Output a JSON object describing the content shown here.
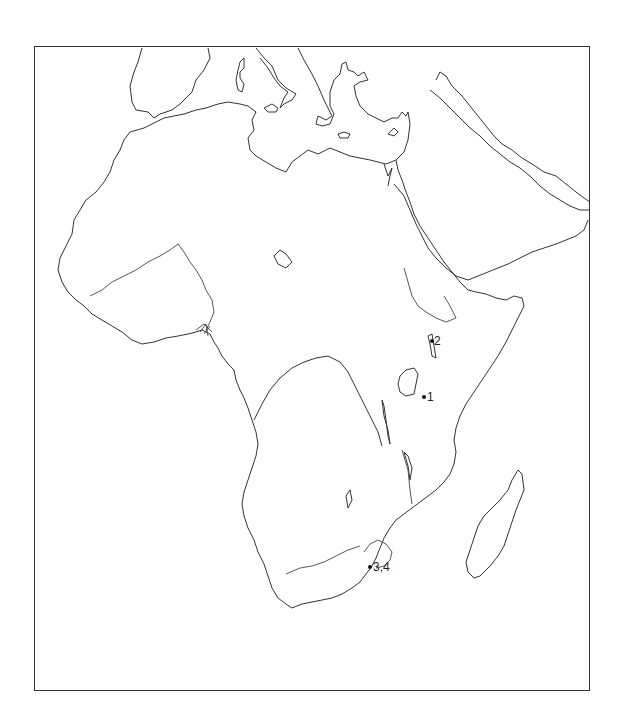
{
  "map": {
    "region": "Africa and Arabian Peninsula outline map",
    "frame": {
      "x": 34,
      "y": 46,
      "width": 556,
      "height": 645
    },
    "line_color": "#333333",
    "background": "#ffffff"
  },
  "sites": [
    {
      "label": "1",
      "x": 424,
      "y": 397,
      "label_dx": 3
    },
    {
      "label": "2",
      "x": 432,
      "y": 341,
      "label_dx": 2
    },
    {
      "label": "3,4",
      "x": 370,
      "y": 567,
      "label_dx": 3
    }
  ]
}
